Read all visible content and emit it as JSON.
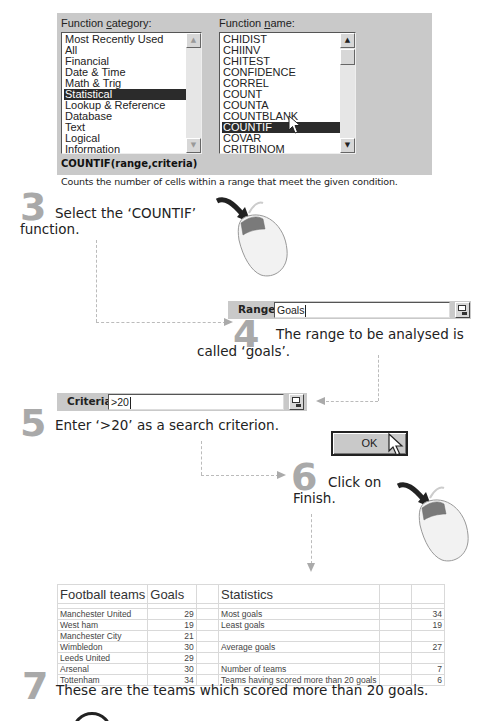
{
  "dialog": {
    "category_label_pre": "Function ",
    "category_label_u": "c",
    "category_label_post": "ategory:",
    "name_label_pre": "Function ",
    "name_label_u": "n",
    "name_label_post": "ame:",
    "categories": [
      "Most Recently Used",
      "All",
      "Financial",
      "Date & Time",
      "Math & Trig",
      "Statistical",
      "Lookup & Reference",
      "Database",
      "Text",
      "Logical",
      "Information"
    ],
    "selected_category": "Statistical",
    "functions": [
      "CHIDIST",
      "CHIINV",
      "CHITEST",
      "CONFIDENCE",
      "CORREL",
      "COUNT",
      "COUNTA",
      "COUNTBLANK",
      "COUNTIF",
      "COVAR",
      "CRITBINOM"
    ],
    "selected_function": "COUNTIF",
    "syntax": "COUNTIF(range,criteria)",
    "description": "Counts the number of cells within a range that meet the given condition.",
    "scroll_up": "▲",
    "scroll_down": "▼"
  },
  "steps": {
    "s3": {
      "num": "3",
      "text_line1": "Select the ‘COUNTIF’",
      "text_line2": "function."
    },
    "s4": {
      "num": "4",
      "text_line1": "The range to be analysed is",
      "text_line2": "called ‘goals’."
    },
    "s5": {
      "num": "5",
      "text": "Enter ‘>20’ as a search criterion."
    },
    "s6": {
      "num": "6",
      "text_line1": "Click on",
      "text_line2": "Finish."
    },
    "s7": {
      "num": "7",
      "text": "These are the teams which scored more than 20 goals."
    }
  },
  "range_field": {
    "label": "Range",
    "value": "Goals"
  },
  "criteria_field": {
    "label": "Criteria",
    "value": ">20"
  },
  "ok_button": {
    "label": "OK"
  },
  "sheet": {
    "header": [
      "Football teams",
      "Goals",
      "",
      "Statistics",
      "",
      ""
    ],
    "rows": [
      [
        "Manchester United",
        "29",
        "",
        "Most goals",
        "",
        "34"
      ],
      [
        "West ham",
        "19",
        "",
        "Least goals",
        "",
        "19"
      ],
      [
        "Manchester City",
        "21",
        "",
        "",
        "",
        ""
      ],
      [
        "Wimbledon",
        "30",
        "",
        "Average goals",
        "",
        "27"
      ],
      [
        "Leeds United",
        "29",
        "",
        "",
        "",
        ""
      ],
      [
        "Arsenal",
        "30",
        "",
        "Number of teams",
        "",
        "7"
      ],
      [
        "Tottenham",
        "34",
        "",
        "Teams having scored more than 20 goals",
        "",
        "6"
      ]
    ]
  }
}
